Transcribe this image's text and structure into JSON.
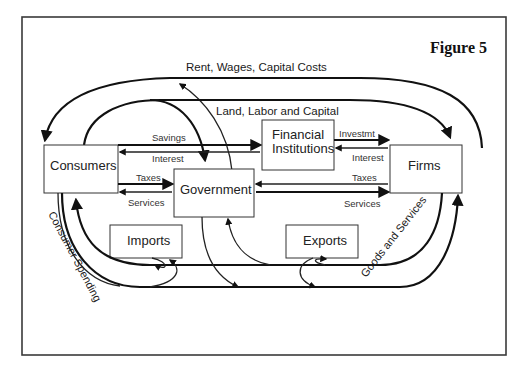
{
  "figure": {
    "title": "Figure 5"
  },
  "nodes": {
    "consumers": "Consumers",
    "financial_line1": "Financial",
    "financial_line2": "Institutions",
    "government": "Government",
    "firms": "Firms",
    "imports": "Imports",
    "exports": "Exports"
  },
  "flows": {
    "outer_top": "Rent, Wages, Capital Costs",
    "inner_top": "Land, Labor and Capital",
    "savings": "Savings",
    "interest_cf": "Interest",
    "investment": "Investmt",
    "interest_ff": "Interest",
    "taxes_consumer": "Taxes",
    "services_consumer": "Services",
    "taxes_firm": "Taxes",
    "services_firm": "Services",
    "consumer_spending": "Consumer Spending",
    "goods_services": "Goods and Services"
  },
  "colors": {
    "line": "#111111",
    "frame": "#3a3a3a",
    "background": "#ffffff"
  }
}
